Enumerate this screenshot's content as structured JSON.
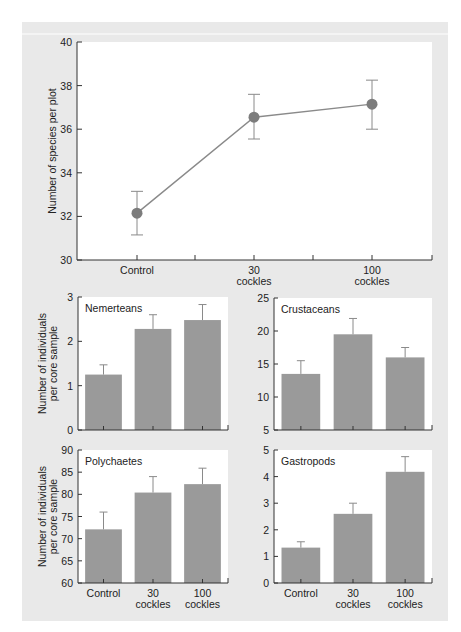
{
  "chart_data": [
    {
      "type": "line",
      "title": "",
      "xlabel": "",
      "ylabel": "Number of species per plot",
      "categories": [
        "Control",
        "30 cockles",
        "100 cockles"
      ],
      "category_lines": [
        [
          "Control"
        ],
        [
          "30",
          "cockles"
        ],
        [
          "100",
          "cockles"
        ]
      ],
      "values": [
        32.15,
        36.55,
        37.15
      ],
      "error_low": [
        31.15,
        35.55,
        36.0
      ],
      "error_high": [
        33.15,
        37.6,
        38.25
      ],
      "ylim": [
        30,
        40
      ],
      "yticks": [
        30,
        32,
        34,
        36,
        38,
        40
      ],
      "grid": false,
      "marker": "circle",
      "color": "#8a8a8a"
    },
    {
      "type": "bar",
      "title": "Nemerteans",
      "xlabel": "",
      "ylabel": "Number of individuals per core sample",
      "categories": [
        "Control",
        "30 cockles",
        "100 cockles"
      ],
      "values": [
        1.25,
        2.28,
        2.48
      ],
      "error_high": [
        1.47,
        2.6,
        2.83
      ],
      "ylim": [
        0,
        3
      ],
      "yticks": [
        0,
        1,
        2,
        3
      ],
      "color": "#9a9a9a"
    },
    {
      "type": "bar",
      "title": "Crustaceans",
      "xlabel": "",
      "ylabel": "",
      "categories": [
        "Control",
        "30 cockles",
        "100 cockles"
      ],
      "values": [
        13.5,
        19.5,
        16.0
      ],
      "error_high": [
        15.5,
        21.9,
        17.5
      ],
      "ylim": [
        5,
        25
      ],
      "yticks": [
        5,
        10,
        15,
        20,
        25
      ],
      "color": "#9a9a9a"
    },
    {
      "type": "bar",
      "title": "Polychaetes",
      "xlabel": "",
      "ylabel": "Number of individuals per core sample",
      "categories": [
        "Control",
        "30 cockles",
        "100 cockles"
      ],
      "values": [
        72.1,
        80.4,
        82.3
      ],
      "error_high": [
        76.0,
        84.0,
        85.9
      ],
      "ylim": [
        60,
        90
      ],
      "yticks": [
        60,
        65,
        70,
        75,
        80,
        85,
        90
      ],
      "color": "#9a9a9a"
    },
    {
      "type": "bar",
      "title": "Gastropods",
      "xlabel": "",
      "ylabel": "",
      "categories": [
        "Control",
        "30 cockles",
        "100 cockles"
      ],
      "values": [
        1.33,
        2.6,
        4.18
      ],
      "error_high": [
        1.55,
        3.0,
        4.75
      ],
      "ylim": [
        0,
        5
      ],
      "yticks": [
        0,
        1,
        2,
        3,
        4,
        5
      ],
      "color": "#9a9a9a"
    }
  ],
  "labels": {
    "top_ylabel": "Number of species per plot",
    "row_ylabel_line1": "Number of individuals",
    "row_ylabel_line2": "per core sample",
    "x_cat_lines": [
      [
        "Control"
      ],
      [
        "30",
        "cockles"
      ],
      [
        "100",
        "cockles"
      ]
    ]
  },
  "colors": {
    "panel_bg": "#e9e9e9",
    "plot_bg": "#ffffff",
    "bar": "#9a9a9a",
    "line": "#8a8a8a",
    "marker": "#7c7c7c",
    "error": "#8a8a8a",
    "axis": "#333333"
  }
}
